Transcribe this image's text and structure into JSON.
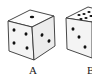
{
  "figure": {
    "type": "dice-diagram",
    "dice": [
      {
        "label": "A",
        "faces": {
          "top": 1,
          "front": 4,
          "right": 2
        }
      },
      {
        "label": "B",
        "faces": {
          "top": 6,
          "front": 3,
          "right": null
        },
        "note": "partially cropped"
      }
    ]
  },
  "colors": {
    "outline": "#333333",
    "pip": "#111111",
    "face_light": "#ffffff",
    "face_shade": "#eeeeee"
  }
}
